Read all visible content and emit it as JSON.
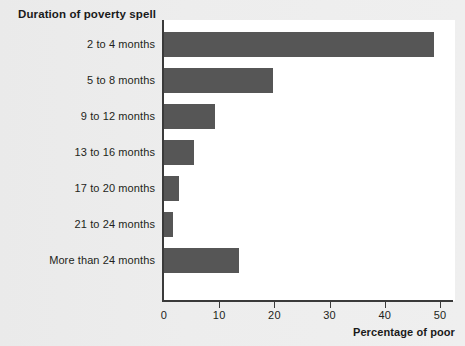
{
  "chart_data": {
    "type": "bar",
    "orientation": "horizontal",
    "title": "Duration of poverty spell",
    "xlabel": "Percentage of poor",
    "ylabel": "Duration of poverty spell",
    "categories": [
      "2 to 4 months",
      "5 to 8 months",
      "9 to 12 months",
      "13 to 16 months",
      "17 to 20 months",
      "21 to 24 months",
      "More than 24 months"
    ],
    "values": [
      49.0,
      19.7,
      9.2,
      5.4,
      2.7,
      1.6,
      13.5
    ],
    "xlim": [
      0,
      50
    ],
    "xticks": [
      0,
      10,
      20,
      30,
      40,
      50
    ],
    "xtick_labels": [
      "0",
      "10",
      "20",
      "30",
      "40",
      "50"
    ],
    "grid": false,
    "legend": false,
    "bar_color": "#565656",
    "plot_background": "#ffffff",
    "page_background": "#ececec",
    "axis_color": "#3a3a3a"
  }
}
